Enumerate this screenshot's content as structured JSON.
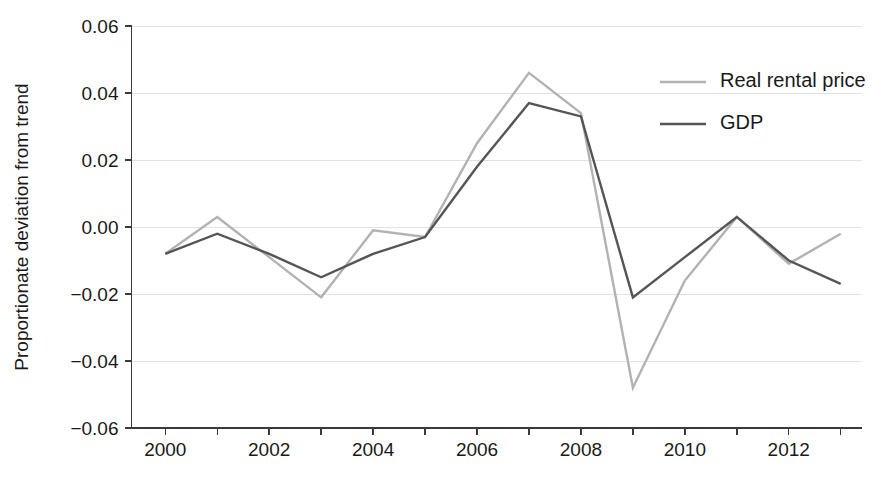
{
  "chart_data": {
    "type": "line",
    "title": "",
    "subtitle": "",
    "xlabel": "",
    "ylabel": "Proportionate deviation from trend",
    "x": [
      2000,
      2001,
      2002,
      2003,
      2004,
      2005,
      2006,
      2007,
      2008,
      2009,
      2010,
      2011,
      2012,
      2013
    ],
    "xlim": [
      1999.35,
      2013.4
    ],
    "ylim": [
      -0.06,
      0.06
    ],
    "x_tick_values": [
      2000,
      2001,
      2002,
      2003,
      2004,
      2005,
      2006,
      2007,
      2008,
      2009,
      2010,
      2011,
      2012,
      2013
    ],
    "x_tick_labels": [
      "2000",
      "",
      "2002",
      "",
      "2004",
      "",
      "2006",
      "",
      "2008",
      "",
      "2010",
      "",
      "2012",
      ""
    ],
    "y_tick_values": [
      -0.06,
      -0.04,
      -0.02,
      0.0,
      0.02,
      0.04,
      0.06
    ],
    "y_tick_labels": [
      "−0.06",
      "−0.04",
      "−0.02",
      "0.00",
      "0.02",
      "0.04",
      "0.06"
    ],
    "grid": true,
    "grid_axis": "y",
    "legend_position": "top-right",
    "series": [
      {
        "name": "Real rental price",
        "color": "#b2b2b2",
        "values": [
          -0.008,
          0.003,
          -0.009,
          -0.021,
          -0.001,
          -0.003,
          0.025,
          0.046,
          0.034,
          -0.048,
          -0.016,
          0.003,
          -0.011,
          -0.002
        ]
      },
      {
        "name": "GDP",
        "color": "#555555",
        "values": [
          -0.008,
          -0.002,
          -0.008,
          -0.015,
          -0.008,
          -0.003,
          0.018,
          0.037,
          0.033,
          -0.021,
          -0.009,
          0.003,
          -0.01,
          -0.017
        ]
      }
    ]
  },
  "axes": {
    "y_axis_title": "Proportionate deviation from trend"
  },
  "legend": {
    "entries": [
      {
        "label": "Real rental price",
        "color": "#b2b2b2"
      },
      {
        "label": "GDP",
        "color": "#555555"
      }
    ]
  },
  "colors": {
    "background": "#ffffff",
    "grid": "#e2e2e2",
    "axis": "#3a3a3a",
    "text": "#1a1a1a",
    "series_rental": "#b2b2b2",
    "series_gdp": "#555555"
  }
}
